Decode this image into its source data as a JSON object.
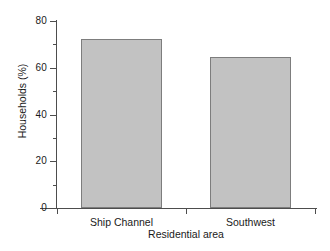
{
  "chart_data": {
    "type": "bar",
    "title": "",
    "subtitle": "",
    "categories": [
      "Ship Channel",
      "Southwest"
    ],
    "values": [
      72.5,
      64.5
    ],
    "xlabel": "Residential area",
    "ylabel": "Households (%)",
    "ylim": [
      0,
      80
    ],
    "y_major_ticks": [
      0,
      20,
      40,
      60,
      80
    ],
    "y_minor_ticks": [
      10,
      30,
      50,
      70
    ],
    "y_tick_labels": [
      "0",
      "20",
      "40",
      "60",
      "80"
    ],
    "grid": false,
    "legend": null,
    "legend_position": "none",
    "annotations": []
  },
  "style": {
    "background": "#ffffff",
    "bar_fill": "#c2c2c2",
    "bar_border": "#7d7d7d",
    "axis_color": "#4d4d4d",
    "text_color": "#1a1a1a"
  },
  "axes": {
    "y_title": "Households (%)",
    "x_title": "Residential area"
  }
}
